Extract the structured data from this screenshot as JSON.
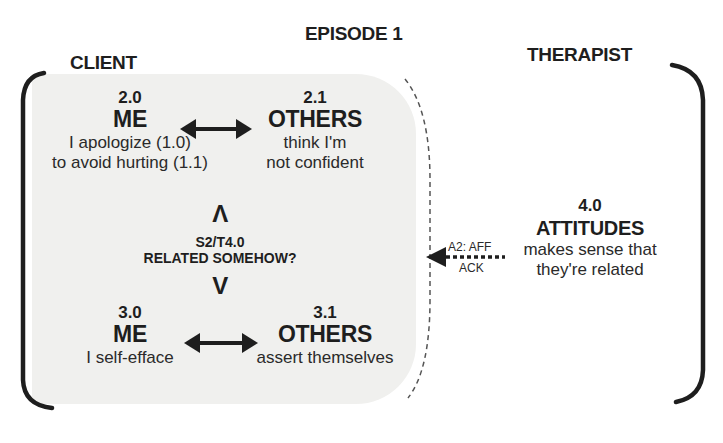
{
  "header": {
    "episode_title": "EPISODE 1"
  },
  "client": {
    "label": "CLIENT",
    "top_pair": {
      "me": {
        "number": "2.0",
        "heading": "ME",
        "lines": [
          "I apologize (1.0)",
          "to avoid hurting (1.1)"
        ]
      },
      "others": {
        "number": "2.1",
        "heading": "OTHERS",
        "lines": [
          "think I'm",
          "not confident"
        ]
      }
    },
    "link": {
      "code": "S2/T4.0",
      "question": "RELATED SOMEHOW?",
      "up_glyph": "Λ",
      "down_glyph": "V"
    },
    "bottom_pair": {
      "me": {
        "number": "3.0",
        "heading": "ME",
        "lines": [
          "I self-efface"
        ]
      },
      "others": {
        "number": "3.1",
        "heading": "OTHERS",
        "lines": [
          "assert themselves"
        ]
      }
    }
  },
  "therapist": {
    "label": "THERAPIST",
    "node": {
      "number": "4.0",
      "heading": "ATTITUDES",
      "lines": [
        "makes sense that",
        "they're related"
      ]
    },
    "response_arrow": {
      "line1": "A2: AFF",
      "line2": "ACK"
    }
  }
}
